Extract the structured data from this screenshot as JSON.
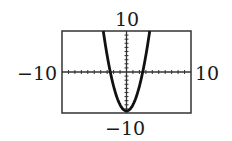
{
  "chart_data": {
    "type": "line",
    "title": "",
    "xlabel": "",
    "ylabel": "",
    "xlim": [
      -10,
      10
    ],
    "ylim": [
      -10,
      10
    ],
    "grid": false,
    "axis_ticks": {
      "x_step": 1,
      "y_step": 1
    },
    "series": [
      {
        "name": "parabola",
        "x": [
          -3.6,
          -3,
          -2.5,
          -2,
          -1,
          0,
          1,
          2,
          2.5,
          3,
          3.6
        ],
        "y": [
          10,
          4,
          0,
          -3.5,
          -8,
          -9.5,
          -8,
          -3.5,
          0,
          4,
          10
        ]
      }
    ],
    "labels": {
      "ymax": "10",
      "ymin": "−10",
      "xmin": "−10",
      "xmax": "10"
    }
  },
  "colors": {
    "curve": "#111111",
    "frame": "#333333",
    "axis": "#333333"
  }
}
